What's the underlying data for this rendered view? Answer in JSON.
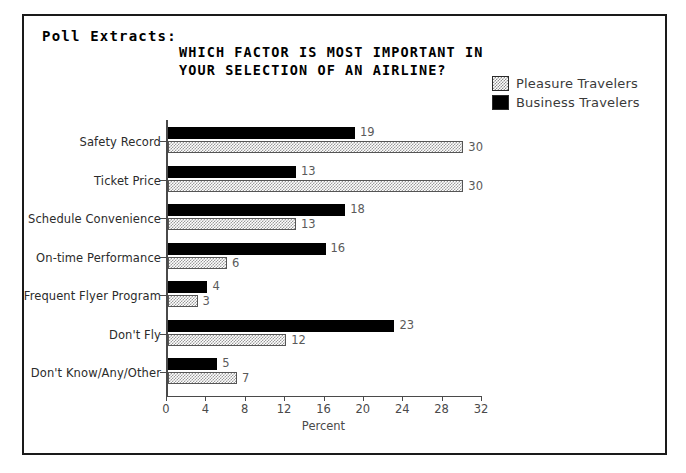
{
  "frame": {
    "section_label": "Poll Extracts:",
    "top_artifact": "",
    "border_color": "#1a1a1a"
  },
  "chart_data": {
    "type": "bar",
    "orientation": "horizontal",
    "title": "WHICH FACTOR IS MOST IMPORTANT IN\nYOUR SELECTION OF AN AIRLINE?",
    "title_line1": "WHICH FACTOR IS MOST IMPORTANT IN",
    "title_line2": "YOUR SELECTION OF AN AIRLINE?",
    "xlabel": "Percent",
    "ylabel": "",
    "xlim": [
      0,
      32
    ],
    "xticks": [
      0,
      4,
      8,
      12,
      16,
      20,
      24,
      28,
      32
    ],
    "grid": false,
    "legend_position": "top-right",
    "categories": [
      "Safety Record",
      "Ticket Price",
      "Schedule Convenience",
      "On-time Performance",
      "Frequent Flyer Program",
      "Don't Fly",
      "Don't Know/Any/Other"
    ],
    "series": [
      {
        "name": "Business Travelers",
        "color": "#000000",
        "pattern": "solid",
        "values": [
          19,
          13,
          18,
          16,
          4,
          23,
          5
        ]
      },
      {
        "name": "Pleasure Travelers",
        "color": "#9a9a9a",
        "pattern": "checker-dither",
        "values": [
          30,
          30,
          13,
          6,
          3,
          12,
          7
        ]
      }
    ]
  }
}
